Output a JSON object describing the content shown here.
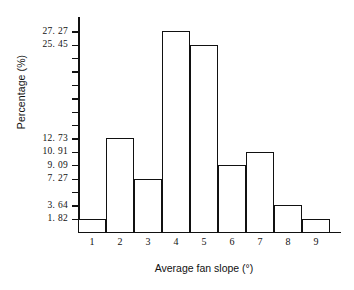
{
  "chart_data": {
    "type": "bar",
    "title": "",
    "subtitle": "",
    "xlabel": "Average fan slope (°)",
    "ylabel": "Percentage (%)",
    "categories": [
      "1",
      "2",
      "3",
      "4",
      "5",
      "6",
      "7",
      "8",
      "9"
    ],
    "values": [
      1.82,
      12.73,
      7.27,
      27.27,
      25.45,
      9.09,
      10.91,
      3.64,
      1.82
    ],
    "ylim": [
      0,
      29.09
    ],
    "xlim_note": "nine equal-width class intervals, one per degree",
    "grid": false,
    "legend": null,
    "annotations": [],
    "y_tick_labels": [
      {
        "value": 27.27,
        "label": "27. 27"
      },
      {
        "value": 25.45,
        "label": "25. 45"
      },
      {
        "value": 12.73,
        "label": "12. 73"
      },
      {
        "value": 10.91,
        "label": "10. 91"
      },
      {
        "value": 9.09,
        "label": "9. 09"
      },
      {
        "value": 7.27,
        "label": "7. 27"
      },
      {
        "value": 3.64,
        "label": "3. 64"
      },
      {
        "value": 1.82,
        "label": "1. 82"
      }
    ],
    "y_tick_values_unlabeled": [
      5.45,
      14.55,
      16.36,
      18.18,
      20.0,
      21.82,
      23.64
    ],
    "colors": {
      "bar_fill": "#ffffff",
      "bar_outline": "#111111",
      "axis": "#111111",
      "text": "#111111",
      "background": "#ffffff"
    }
  }
}
